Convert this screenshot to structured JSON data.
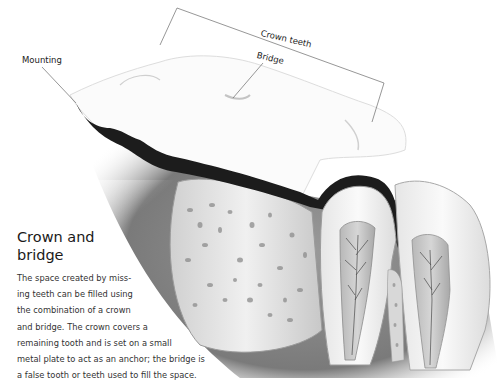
{
  "diagram": {
    "labels": {
      "mounting": "Mounting",
      "crown_teeth": "Crown teeth",
      "bridge": "Bridge"
    },
    "caption": {
      "title": "Crown and bridge",
      "body_lines": [
        "The space created by miss-",
        "ing teeth can be filled using",
        "the combination of a crown",
        "and bridge. The crown covers a",
        "remaining tooth and is set on a small",
        "metal plate to act as an anchor; the bridge is",
        "a false tooth or teeth used to fill the space."
      ]
    },
    "colors": {
      "background": "#ffffff",
      "gum": "#8a8a8a",
      "bone": "#c8c8c8",
      "tooth": "#f4f4f4",
      "plate": "#1c1c1c",
      "leader_line": "#6a6a6a"
    }
  }
}
